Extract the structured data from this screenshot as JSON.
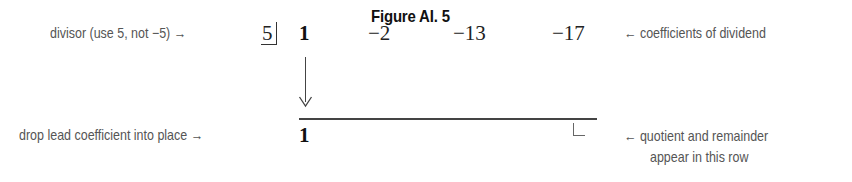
{
  "figure": {
    "title": "Figure AI. 5"
  },
  "left_annotations": {
    "divisor_note": "divisor (use 5, not −5) →",
    "drop_note": "drop lead coefficient into place →"
  },
  "synthetic_division": {
    "divisor": "5",
    "dividend_coefficients": [
      "1",
      "−2",
      "−13",
      "−17"
    ],
    "bottom_row": [
      "1"
    ],
    "drop_arrow": "↓"
  },
  "right_annotations": {
    "coefficients_note": "← coefficients of dividend",
    "result_note_line1": "← quotient and remainder",
    "result_note_line2": "appear in this row"
  }
}
